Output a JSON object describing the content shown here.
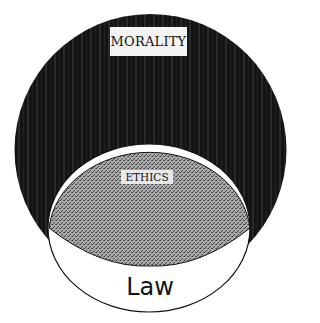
{
  "diagram": {
    "type": "nested-venn",
    "regions": [
      {
        "id": "morality",
        "label": "MORALITY",
        "fill": "#151515"
      },
      {
        "id": "ethics",
        "label": "ETHICS",
        "fill": "#9a9a9a"
      },
      {
        "id": "law",
        "label": "Law",
        "fill": "#ffffff"
      }
    ]
  },
  "labels": {
    "morality": "MORALITY",
    "ethics": "ETHICS",
    "law": "Law"
  },
  "colors": {
    "morality_fill": "#151515",
    "ethics_fill": "#9a9a9a",
    "law_fill": "#ffffff",
    "stroke": "#111111"
  }
}
